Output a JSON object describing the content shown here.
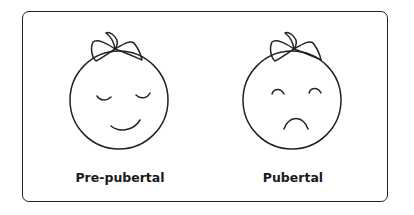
{
  "figure": {
    "panels": [
      {
        "label": "Pre-pubertal",
        "expression": "content",
        "eyes": "closed-relaxed",
        "mouth": "smile",
        "accessory": "bow"
      },
      {
        "label": "Pubertal",
        "expression": "sad",
        "eyes": "raised-arches",
        "mouth": "frown",
        "accessory": "bow"
      }
    ],
    "colors": {
      "stroke": "#222222",
      "background": "#ffffff"
    }
  }
}
